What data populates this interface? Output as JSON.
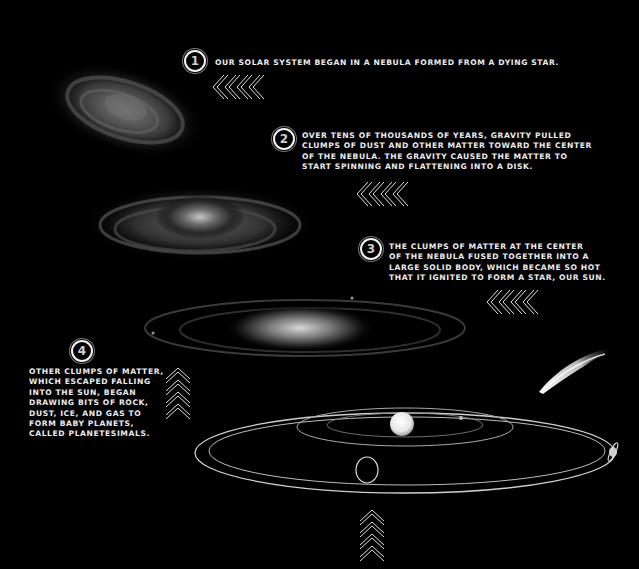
{
  "steps": [
    {
      "number": "1",
      "lines": [
        "Our solar system began in a nebula formed from a dying star."
      ]
    },
    {
      "number": "2",
      "lines": [
        "Over tens of thousands of years, gravity pulled",
        "clumps of dust and other matter toward the center",
        "of the nebula. The gravity caused the matter to",
        "start spinning and flattening into a disk."
      ]
    },
    {
      "number": "3",
      "lines": [
        "The clumps of matter at the center",
        "of the nebula fused together into a",
        "large solid body, which became so hot",
        "that it ignited to form a star, our sun."
      ]
    },
    {
      "number": "4",
      "lines": [
        "Other clumps of matter,",
        "which escaped falling",
        "into the sun, began",
        "drawing bits of rock,",
        "dust, ice, and gas to",
        "form baby planets,",
        "called planetesimals."
      ]
    }
  ],
  "illustrations": {
    "nebula": "nebula-image",
    "spinning_disk": "spinning-disk-image",
    "flattened_disk": "flattened-disk-image",
    "solar_system": "solar-system-orbits-image",
    "comet": "comet-image"
  },
  "colors": {
    "background": "#000000",
    "text": "#ececec",
    "accent": "#ffffff"
  }
}
